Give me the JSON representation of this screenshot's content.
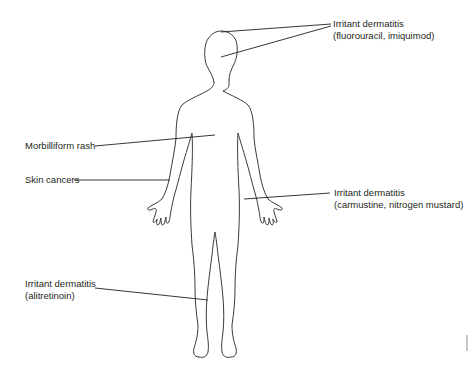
{
  "figure": {
    "type": "body-outline-diagram"
  },
  "annotations": [
    {
      "id": "head",
      "lines": [
        "Irritant dermatitis",
        "(fluorouracil, imiquimod)"
      ],
      "target": "scalp and face"
    },
    {
      "id": "trunk",
      "lines": [
        "Morbilliform rash"
      ],
      "target": "trunk"
    },
    {
      "id": "arm",
      "lines": [
        "Skin cancers"
      ],
      "target": "left forearm"
    },
    {
      "id": "right-hand",
      "lines": [
        "Irritant dermatitis",
        "(carmustine, nitrogen mustard)"
      ],
      "target": "right wrist / thigh"
    },
    {
      "id": "leg",
      "lines": [
        "Irritant dermatitis",
        "(alitretinoin)"
      ],
      "target": "lower leg"
    }
  ],
  "colors": {
    "outline": "#3a3a3a",
    "leader": "#231f20",
    "text": "#231f20"
  }
}
